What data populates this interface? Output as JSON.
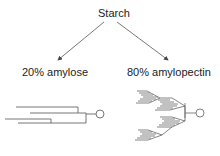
{
  "diagram": {
    "root": {
      "label": "Starch"
    },
    "branches": [
      {
        "label": "20% amylose",
        "structure": "linear chains"
      },
      {
        "label": "80% amylopectin",
        "structure": "highly branched chains"
      }
    ],
    "colors": {
      "line": "#555555",
      "text": "#222222",
      "background": "#ffffff"
    }
  }
}
